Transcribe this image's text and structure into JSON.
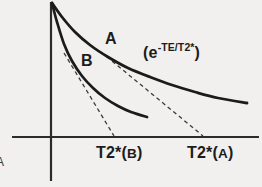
{
  "figure": {
    "background": "#f1f0ee",
    "ink": "#1b1b1b",
    "axis_color": "#2b2b2b",
    "dash_color": "#3a3a3a",
    "axes": {
      "y_axis": {
        "x1": 51,
        "y1": 2,
        "x2": 51,
        "y2": 181
      },
      "x_axis": {
        "x1": 12,
        "y1": 137,
        "x2": 259,
        "y2": 137
      }
    },
    "curves": {
      "a": {
        "label": "A",
        "points": [
          [
            52,
            3
          ],
          [
            62,
            17
          ],
          [
            75,
            32
          ],
          [
            90,
            45
          ],
          [
            108,
            57
          ],
          [
            128,
            68
          ],
          [
            150,
            77
          ],
          [
            172,
            85
          ],
          [
            195,
            92
          ],
          [
            218,
            98
          ],
          [
            247,
            103
          ]
        ]
      },
      "b": {
        "label": "B",
        "points": [
          [
            52,
            3
          ],
          [
            57,
            22
          ],
          [
            64,
            44
          ],
          [
            72,
            61
          ],
          [
            82,
            76
          ],
          [
            93,
            88
          ],
          [
            105,
            98
          ],
          [
            118,
            106
          ],
          [
            131,
            112
          ],
          [
            147,
            117
          ]
        ]
      }
    },
    "tangents": {
      "a": {
        "x1": 101,
        "y1": 52,
        "x2": 203,
        "y2": 136
      },
      "b": {
        "x1": 64,
        "y1": 53,
        "x2": 114,
        "y2": 136
      }
    },
    "formula": {
      "open": "(e",
      "sup": "-TE/T2*",
      "close": ")"
    },
    "x_axis_labels": {
      "b": {
        "prefix": "T2*(",
        "letter": "B",
        "suffix": ")"
      },
      "a": {
        "prefix": "T2*(",
        "letter": "A",
        "suffix": ")"
      }
    },
    "panel_label": "A"
  }
}
